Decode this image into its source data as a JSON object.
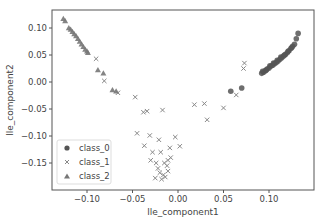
{
  "chart_data": {
    "type": "scatter",
    "title": "",
    "xlabel": "lle_component1",
    "ylabel": "lle_component2",
    "xlim": [
      -0.138,
      0.149
    ],
    "ylim": [
      -0.2,
      0.133
    ],
    "xticks": [
      -0.1,
      -0.05,
      0.0,
      0.05,
      0.1
    ],
    "xtick_labels": [
      "−0.10",
      "−0.05",
      "0.00",
      "0.05",
      "0.10"
    ],
    "yticks": [
      0.1,
      0.05,
      0.0,
      -0.05,
      -0.1,
      -0.15
    ],
    "ytick_labels": [
      "0.10",
      "0.05",
      "0.00",
      "−0.05",
      "−0.10",
      "−0.15"
    ],
    "grid": false,
    "legend_position": "lower left",
    "series": [
      {
        "name": "class_0",
        "marker": "circle",
        "color": "#555555",
        "points": [
          [
            0.092,
            0.016
          ],
          [
            0.094,
            0.018
          ],
          [
            0.096,
            0.021
          ],
          [
            0.098,
            0.024
          ],
          [
            0.1,
            0.026
          ],
          [
            0.102,
            0.029
          ],
          [
            0.104,
            0.031
          ],
          [
            0.106,
            0.034
          ],
          [
            0.108,
            0.036
          ],
          [
            0.11,
            0.039
          ],
          [
            0.112,
            0.042
          ],
          [
            0.114,
            0.045
          ],
          [
            0.116,
            0.048
          ],
          [
            0.118,
            0.051
          ],
          [
            0.12,
            0.054
          ],
          [
            0.122,
            0.058
          ],
          [
            0.124,
            0.062
          ],
          [
            0.126,
            0.066
          ],
          [
            0.128,
            0.07
          ],
          [
            0.132,
            0.09
          ],
          [
            0.093,
            0.02
          ],
          [
            0.097,
            0.022
          ],
          [
            0.101,
            0.03
          ],
          [
            0.105,
            0.035
          ],
          [
            0.109,
            0.04
          ],
          [
            0.113,
            0.046
          ],
          [
            0.117,
            0.05
          ],
          [
            0.121,
            0.057
          ],
          [
            0.125,
            0.064
          ],
          [
            0.13,
            0.08
          ],
          [
            0.058,
            -0.017
          ],
          [
            0.07,
            -0.011
          ]
        ]
      },
      {
        "name": "class_1",
        "marker": "x",
        "color": "#888888",
        "points": [
          [
            -0.09,
            0.043
          ],
          [
            -0.081,
            0.002
          ],
          [
            -0.066,
            -0.02
          ],
          [
            -0.047,
            -0.028
          ],
          [
            -0.038,
            -0.056
          ],
          [
            -0.034,
            -0.054
          ],
          [
            -0.017,
            -0.052
          ],
          [
            0.018,
            -0.042
          ],
          [
            0.029,
            -0.04
          ],
          [
            0.032,
            -0.07
          ],
          [
            0.073,
            0.035
          ],
          [
            0.072,
            0.025
          ],
          [
            0.064,
            -0.024
          ],
          [
            0.05,
            -0.048
          ],
          [
            -0.045,
            -0.095
          ],
          [
            -0.031,
            -0.099
          ],
          [
            -0.021,
            -0.107
          ],
          [
            -0.037,
            -0.118
          ],
          [
            -0.003,
            -0.102
          ],
          [
            -0.009,
            -0.122
          ],
          [
            0.002,
            -0.119
          ],
          [
            -0.028,
            -0.13
          ],
          [
            -0.019,
            -0.13
          ],
          [
            -0.03,
            -0.145
          ],
          [
            -0.011,
            -0.145
          ],
          [
            -0.011,
            -0.165
          ],
          [
            -0.025,
            -0.178
          ],
          [
            -0.02,
            -0.168
          ],
          [
            -0.016,
            -0.172
          ],
          [
            -0.014,
            -0.176
          ],
          [
            -0.018,
            -0.18
          ],
          [
            -0.022,
            -0.16
          ],
          [
            -0.012,
            -0.155
          ],
          [
            -0.008,
            -0.14
          ],
          [
            -0.015,
            -0.15
          ],
          [
            -0.024,
            -0.15
          ]
        ]
      },
      {
        "name": "class_2",
        "marker": "triangle",
        "color": "#777777",
        "points": [
          [
            -0.126,
            0.117
          ],
          [
            -0.124,
            0.113
          ],
          [
            -0.12,
            0.1
          ],
          [
            -0.118,
            0.097
          ],
          [
            -0.116,
            0.093
          ],
          [
            -0.114,
            0.089
          ],
          [
            -0.112,
            0.085
          ],
          [
            -0.11,
            0.08
          ],
          [
            -0.108,
            0.075
          ],
          [
            -0.106,
            0.07
          ],
          [
            -0.104,
            0.065
          ],
          [
            -0.102,
            0.06
          ],
          [
            -0.1,
            0.057
          ],
          [
            -0.099,
            0.054
          ],
          [
            -0.088,
            0.022
          ],
          [
            -0.082,
            0.016
          ],
          [
            -0.072,
            -0.015
          ],
          [
            -0.068,
            -0.017
          ]
        ]
      }
    ]
  },
  "legend": {
    "items": [
      {
        "label": "class_0",
        "marker": "circle"
      },
      {
        "label": "class_1",
        "marker": "x"
      },
      {
        "label": "class_2",
        "marker": "triangle"
      }
    ]
  }
}
